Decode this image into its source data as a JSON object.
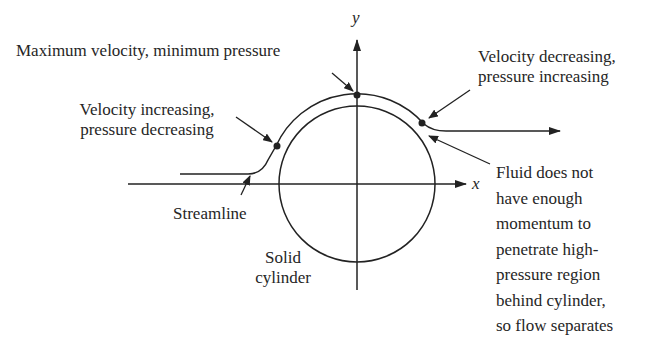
{
  "diagram": {
    "axes": {
      "x_label": "x",
      "y_label": "y"
    },
    "labels": {
      "top": "Maximum velocity, minimum pressure",
      "left_line1": "Velocity increasing,",
      "left_line2": "pressure decreasing",
      "right_line1": "Velocity decreasing,",
      "right_line2": "pressure increasing",
      "streamline": "Streamline",
      "solid_line1": "Solid",
      "solid_line2": "cylinder",
      "fluid": [
        "Fluid does not",
        "have enough",
        "momentum to",
        "penetrate high-",
        "pressure region",
        "behind cylinder,",
        "so flow separates"
      ]
    },
    "colors": {
      "line": "#222222",
      "background": "#ffffff"
    }
  }
}
